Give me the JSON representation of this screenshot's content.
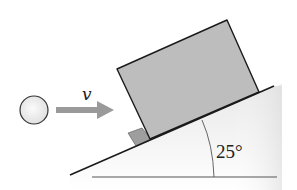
{
  "diagram": {
    "type": "physics-free-body-setup",
    "velocity_label": "v",
    "angle_label": "25°",
    "colors": {
      "block_fill": "#bdbdbd",
      "stopper_fill": "#9e9e9e",
      "ball_fill": "#f2f2f2",
      "arrow_fill": "#9a9a9a",
      "line": "#1a1a1a",
      "ground_shade": "#e4e4e4"
    }
  }
}
